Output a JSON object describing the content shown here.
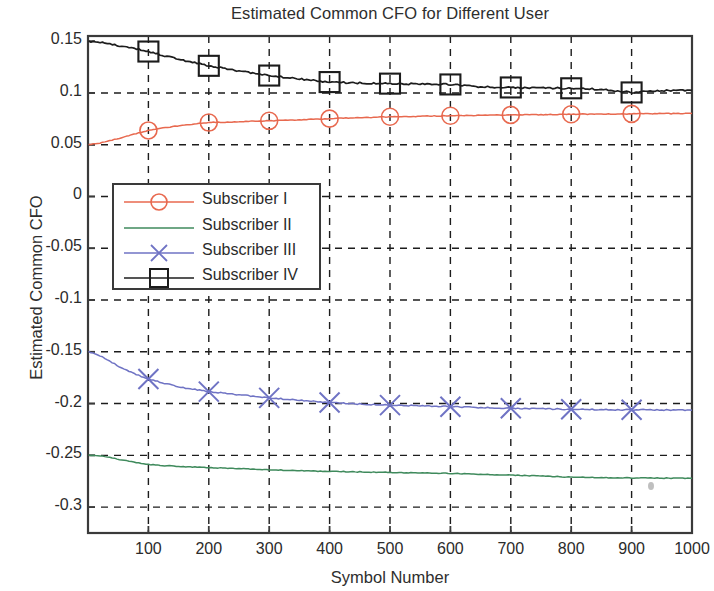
{
  "chart_data": {
    "type": "line",
    "title": "Estimated Common CFO for Different User",
    "xlabel": "Symbol Number",
    "ylabel": "Estimated Common CFO",
    "xlim": [
      0,
      1000
    ],
    "ylim": [
      -0.325,
      0.155
    ],
    "grid": true,
    "grid_style": "dashed",
    "legend_position": "center-left",
    "xticks": [
      100,
      200,
      300,
      400,
      500,
      600,
      700,
      800,
      900,
      1000
    ],
    "xticklabels": [
      "100",
      "200",
      "300",
      "400",
      "500",
      "600",
      "700",
      "800",
      "900",
      "1000"
    ],
    "yticks": [
      0.15,
      0.1,
      0.05,
      0,
      -0.05,
      -0.1,
      -0.15,
      -0.2,
      -0.25,
      -0.3
    ],
    "yticklabels": [
      "0.15",
      "0.1",
      "0.05",
      "0",
      "-0.05",
      "-0.1",
      "-0.15",
      "-0.2",
      "-0.25",
      "-0.3"
    ],
    "marker_x": [
      100,
      200,
      300,
      400,
      500,
      600,
      700,
      800,
      900
    ],
    "series": [
      {
        "name": "Subscriber I",
        "color": "#e8694f",
        "marker": "circle",
        "x": [
          1,
          20,
          40,
          60,
          80,
          100,
          140,
          180,
          200,
          250,
          300,
          350,
          400,
          450,
          500,
          550,
          600,
          650,
          700,
          750,
          800,
          850,
          900,
          950,
          1000
        ],
        "y": [
          0.05,
          0.0515,
          0.0545,
          0.0575,
          0.0608,
          0.0638,
          0.0675,
          0.0703,
          0.0714,
          0.0722,
          0.0731,
          0.074,
          0.0752,
          0.0762,
          0.077,
          0.0775,
          0.078,
          0.0784,
          0.0788,
          0.0791,
          0.0794,
          0.0796,
          0.0798,
          0.08,
          0.0802
        ],
        "marker_y": [
          0.0638,
          0.0714,
          0.0731,
          0.0752,
          0.077,
          0.078,
          0.0788,
          0.0794,
          0.0798
        ]
      },
      {
        "name": "Subscriber II",
        "color": "#3f8a5c",
        "marker": "none",
        "x": [
          1,
          20,
          40,
          60,
          80,
          100,
          150,
          200,
          250,
          300,
          350,
          400,
          450,
          500,
          550,
          600,
          650,
          700,
          750,
          800,
          850,
          900,
          950,
          1000
        ],
        "y": [
          -0.25,
          -0.2505,
          -0.2525,
          -0.2548,
          -0.257,
          -0.2588,
          -0.2608,
          -0.2618,
          -0.2628,
          -0.264,
          -0.2648,
          -0.2655,
          -0.266,
          -0.2665,
          -0.267,
          -0.2675,
          -0.2683,
          -0.269,
          -0.27,
          -0.271,
          -0.2715,
          -0.2718,
          -0.272,
          -0.2722
        ],
        "marker_y": []
      },
      {
        "name": "Subscriber III",
        "color": "#6f73c4",
        "marker": "x",
        "x": [
          1,
          20,
          40,
          60,
          80,
          100,
          150,
          200,
          250,
          300,
          350,
          400,
          450,
          500,
          550,
          600,
          650,
          700,
          750,
          800,
          850,
          900,
          950,
          1000
        ],
        "y": [
          -0.15,
          -0.154,
          -0.1605,
          -0.1668,
          -0.172,
          -0.1762,
          -0.184,
          -0.1885,
          -0.1915,
          -0.1945,
          -0.1968,
          -0.199,
          -0.2005,
          -0.2015,
          -0.2022,
          -0.203,
          -0.2038,
          -0.2045,
          -0.205,
          -0.2055,
          -0.2058,
          -0.206,
          -0.2062,
          -0.2064
        ],
        "marker_y": [
          -0.1762,
          -0.1885,
          -0.1945,
          -0.199,
          -0.2015,
          -0.203,
          -0.2045,
          -0.2055,
          -0.206
        ]
      },
      {
        "name": "Subscriber IV",
        "color": "#1c1c1c",
        "marker": "square",
        "x": [
          1,
          20,
          40,
          60,
          80,
          100,
          150,
          200,
          250,
          300,
          350,
          400,
          450,
          500,
          550,
          600,
          650,
          700,
          750,
          800,
          850,
          900,
          950,
          1000
        ],
        "y": [
          0.1495,
          0.1487,
          0.1468,
          0.1447,
          0.1425,
          0.14,
          0.1325,
          0.1262,
          0.1212,
          0.1168,
          0.1135,
          0.1105,
          0.1095,
          0.109,
          0.1085,
          0.1082,
          0.106,
          0.1053,
          0.1048,
          0.1045,
          0.1035,
          0.1005,
          0.1022,
          0.1025
        ],
        "marker_y": [
          0.14,
          0.1262,
          0.1168,
          0.1105,
          0.109,
          0.1082,
          0.1053,
          0.1045,
          0.1005
        ]
      }
    ]
  },
  "legend": {
    "entries": [
      {
        "label": "Subscriber I"
      },
      {
        "label": "Subscriber II"
      },
      {
        "label": "Subscriber III"
      },
      {
        "label": "Subscriber IV"
      }
    ]
  }
}
